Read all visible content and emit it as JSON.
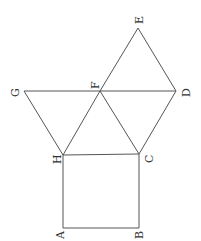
{
  "diagram": {
    "points": {
      "A": [
        63,
        228
      ],
      "B": [
        139,
        228
      ],
      "C": [
        139,
        154
      ],
      "H": [
        63,
        155
      ],
      "G": [
        24,
        91
      ],
      "F": [
        100,
        91
      ],
      "D": [
        176,
        91
      ],
      "E": [
        138,
        28
      ]
    },
    "labels": {
      "A": "A",
      "B": "B",
      "C": "C",
      "D": "D",
      "E": "E",
      "F": "F",
      "G": "G",
      "H": "H"
    },
    "segments": [
      [
        "A",
        "B"
      ],
      [
        "B",
        "C"
      ],
      [
        "C",
        "H"
      ],
      [
        "H",
        "A"
      ],
      [
        "G",
        "D"
      ],
      [
        "G",
        "H"
      ],
      [
        "H",
        "F"
      ],
      [
        "F",
        "C"
      ],
      [
        "C",
        "D"
      ],
      [
        "D",
        "E"
      ],
      [
        "E",
        "F"
      ]
    ],
    "color": "#555555"
  }
}
